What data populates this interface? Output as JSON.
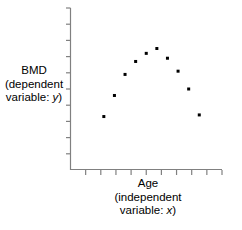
{
  "chart_data": {
    "type": "scatter",
    "title": "",
    "xlabel": "Age (independent variable: x)",
    "ylabel": "BMD (dependent variable: y)",
    "xlim": [
      0,
      10
    ],
    "ylim": [
      0,
      10
    ],
    "grid": false,
    "legend": null,
    "x": [
      2.2,
      2.9,
      3.6,
      4.3,
      5.0,
      5.7,
      6.4,
      7.1,
      7.8,
      8.5
    ],
    "y": [
      3.3,
      4.6,
      5.9,
      6.7,
      7.2,
      7.5,
      6.9,
      6.1,
      5.0,
      3.4
    ],
    "series": [
      {
        "name": "BMD vs Age",
        "marker": "square",
        "marker_color": "#000000",
        "marker_size": 3,
        "points": [
          {
            "x": 2.2,
            "y": 3.3
          },
          {
            "x": 2.9,
            "y": 4.6
          },
          {
            "x": 3.6,
            "y": 5.9
          },
          {
            "x": 4.3,
            "y": 6.7
          },
          {
            "x": 5.0,
            "y": 7.2
          },
          {
            "x": 5.7,
            "y": 7.5
          },
          {
            "x": 6.4,
            "y": 6.9
          },
          {
            "x": 7.1,
            "y": 6.1
          },
          {
            "x": 7.8,
            "y": 5.0
          },
          {
            "x": 8.5,
            "y": 3.4
          }
        ]
      }
    ],
    "x_ticks": [
      1,
      2,
      3,
      4,
      5,
      6,
      7,
      8,
      9,
      10
    ],
    "y_ticks": [
      1,
      2,
      3,
      4,
      5,
      6,
      7,
      8,
      9,
      10
    ],
    "x_tick_labels": [],
    "y_tick_labels": [],
    "axis_color": "#808080",
    "shape_description": "inverted-U / parabolic rise and fall"
  },
  "labels": {
    "y_axis": {
      "line1": "BMD",
      "line2": "(dependent",
      "line3_prefix": "variable: ",
      "line3_var": "y",
      "line3_suffix": ")"
    },
    "x_axis": {
      "line1": "Age",
      "line2": "(independent",
      "line3_prefix": "variable: ",
      "line3_var": "x",
      "line3_suffix": ")"
    }
  }
}
